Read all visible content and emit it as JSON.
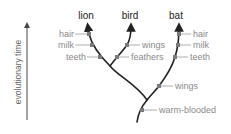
{
  "diagram": {
    "type": "cladogram",
    "axis": {
      "label": "evolutionary time",
      "direction": "up"
    },
    "taxa": [
      {
        "label": "lion",
        "x": 86,
        "y": 19
      },
      {
        "label": "bird",
        "x": 130,
        "y": 19
      },
      {
        "label": "bat",
        "x": 176,
        "y": 19
      }
    ],
    "traits": [
      {
        "label": "hair",
        "branch": "lion",
        "side": "left",
        "node": [
          89,
          34
        ],
        "text": [
          57,
          37
        ]
      },
      {
        "label": "milk",
        "branch": "lion",
        "side": "left",
        "node": [
          92,
          45
        ],
        "text": [
          57,
          48
        ]
      },
      {
        "label": "teeth",
        "branch": "lion",
        "side": "left",
        "node": [
          100,
          57
        ],
        "text": [
          63,
          59
        ]
      },
      {
        "label": "wings",
        "branch": "bird",
        "side": "right",
        "node": [
          127,
          45
        ],
        "text": [
          142,
          48
        ]
      },
      {
        "label": "feathers",
        "branch": "bird",
        "side": "right",
        "node": [
          117,
          57
        ],
        "text": [
          131,
          59
        ]
      },
      {
        "label": "hair",
        "branch": "bat",
        "side": "right",
        "node": [
          179,
          34
        ],
        "text": [
          193,
          37
        ]
      },
      {
        "label": "milk",
        "branch": "bat",
        "side": "right",
        "node": [
          178,
          45
        ],
        "text": [
          193,
          48
        ]
      },
      {
        "label": "teeth",
        "branch": "bat",
        "side": "right",
        "node": [
          175,
          57
        ],
        "text": [
          190,
          59
        ]
      },
      {
        "label": "wings",
        "branch": "lion-bird-bat",
        "side": "right",
        "node": [
          159,
          86
        ],
        "text": [
          175,
          89
        ]
      },
      {
        "label": "warm-blooded",
        "branch": "root",
        "side": "right",
        "node": [
          142,
          110
        ],
        "text": [
          159,
          113
        ]
      }
    ],
    "colors": {
      "branch": "#222222",
      "node": "#7a7a7a",
      "trait_text": "#8a8a8a",
      "leader": "#9a9a9a",
      "axis": "#444444"
    }
  }
}
